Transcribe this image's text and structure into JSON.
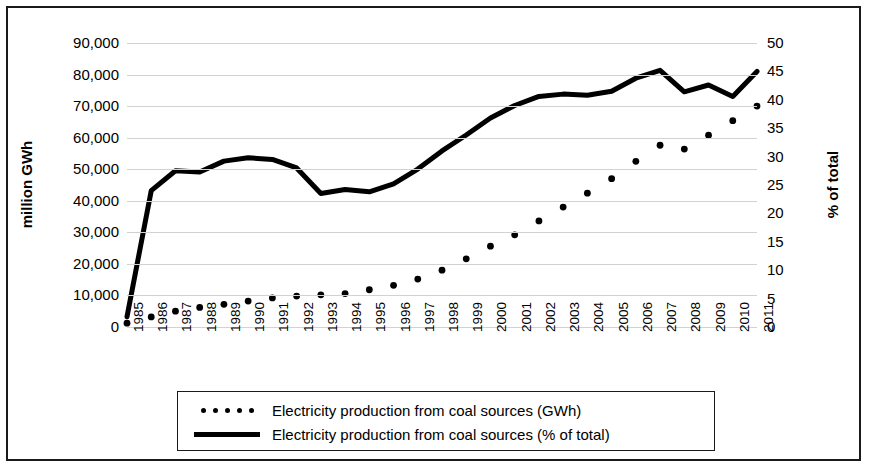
{
  "chart_data": {
    "type": "line",
    "title": "",
    "xlabel": "",
    "categories": [
      "1985",
      "1986",
      "1987",
      "1988",
      "1989",
      "1990",
      "1991",
      "1992",
      "1993",
      "1994",
      "1995",
      "1996",
      "1997",
      "1998",
      "1999",
      "2000",
      "2001",
      "2002",
      "2003",
      "2004",
      "2005",
      "2006",
      "2007",
      "2008",
      "2009",
      "2010",
      "2011"
    ],
    "left_axis": {
      "label": "million GWh",
      "ticks": [
        "0",
        "10,000",
        "20,000",
        "30,000",
        "40,000",
        "50,000",
        "60,000",
        "70,000",
        "80,000",
        "90,000"
      ],
      "tick_values": [
        0,
        10000,
        20000,
        30000,
        40000,
        50000,
        60000,
        70000,
        80000,
        90000
      ],
      "ylim": [
        0,
        90000
      ]
    },
    "right_axis": {
      "label": "% of total",
      "ticks": [
        "0",
        "5",
        "10",
        "15",
        "20",
        "25",
        "30",
        "35",
        "40",
        "45",
        "50"
      ],
      "tick_values": [
        0,
        5,
        10,
        15,
        20,
        25,
        30,
        35,
        40,
        45,
        50
      ],
      "ylim": [
        0,
        50
      ]
    },
    "grid": true,
    "legend_position": "bottom",
    "series": [
      {
        "name": "Electricity production from coal sources (GWh)",
        "style": "dotted",
        "axis": "left",
        "units": "GWh",
        "values": [
          1200,
          3200,
          5000,
          6200,
          7200,
          8200,
          9200,
          9800,
          10200,
          10600,
          11800,
          13200,
          15200,
          18000,
          21600,
          25600,
          29200,
          33600,
          38000,
          42400,
          47000,
          52500,
          57600,
          56400,
          60800,
          65400,
          70000
        ]
      },
      {
        "name": "Electricity production from coal sources (% of total)",
        "style": "solid",
        "axis": "right",
        "units": "%",
        "values": [
          1.8,
          24.0,
          27.5,
          27.3,
          29.2,
          29.8,
          29.5,
          28.0,
          23.5,
          24.2,
          23.8,
          25.2,
          27.8,
          31.0,
          33.8,
          36.8,
          39.0,
          40.6,
          41.0,
          40.8,
          41.5,
          43.8,
          45.2,
          41.4,
          42.6,
          40.6,
          45.0
        ]
      }
    ]
  },
  "legend": {
    "items": [
      {
        "label": "Electricity production from coal sources (GWh)",
        "marker": "dotted-line-swatch"
      },
      {
        "label": "Electricity production from coal sources (% of total)",
        "marker": "solid-line-swatch"
      }
    ]
  }
}
